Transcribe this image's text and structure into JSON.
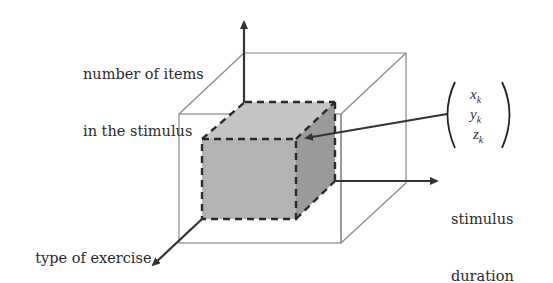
{
  "diagram": {
    "type": "3d-parameter-space",
    "axes": {
      "vertical": {
        "label_line1": "number of items",
        "label_line2": "in the stimulus"
      },
      "horizontal": {
        "label_line1": "stimulus",
        "label_line2": "duration"
      },
      "depth": {
        "label": "type of exercise"
      }
    },
    "vector": {
      "components": [
        {
          "symbol": "x",
          "subscript": "k"
        },
        {
          "symbol": "y",
          "subscript": "k"
        },
        {
          "symbol": "z",
          "subscript": "k"
        }
      ]
    },
    "colors": {
      "outer_box_stroke": "#888888",
      "axis_stroke": "#333333",
      "cube_front": "#b3b3b3",
      "cube_top": "#c4c4c4",
      "cube_side": "#9a9a9a",
      "cube_dash": "#2a2a2a"
    }
  }
}
